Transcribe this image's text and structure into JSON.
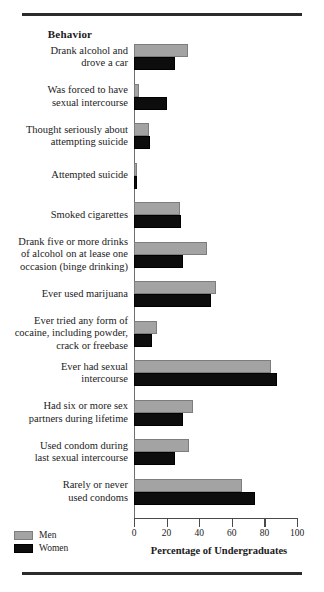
{
  "figure": {
    "column_header": "Behavior",
    "x_axis_title": "Percentage of Undergraduates"
  },
  "legend": {
    "items": [
      {
        "label": "Men",
        "color": "#a3a3a3"
      },
      {
        "label": "Women",
        "color": "#0d0d0d"
      }
    ]
  },
  "chart_data": {
    "type": "bar",
    "orientation": "horizontal",
    "title": "",
    "xlabel": "Percentage of Undergraduates",
    "ylabel": "Behavior",
    "xlim": [
      0,
      100
    ],
    "xticks": [
      0,
      20,
      40,
      60,
      80,
      100
    ],
    "grid": false,
    "legend_position": "bottom-left",
    "categories": [
      "Drank alcohol and drove a car",
      "Was forced to have sexual intercourse",
      "Thought seriously about attempting suicide",
      "Attempted suicide",
      "Smoked cigarettes",
      "Drank five or more drinks of alcohol on at lease one occasion (binge drinking)",
      "Ever used marijuana",
      "Ever tried any form of cocaine, including powder, crack or freebase",
      "Ever had sexual intercourse",
      "Had six or more sex partners during lifetime",
      "Used condom during last sexual intercourse",
      "Rarely or never used condoms"
    ],
    "category_lines": [
      [
        "Drank alcohol and",
        "drove a car"
      ],
      [
        "Was forced to have",
        "sexual intercourse"
      ],
      [
        "Thought seriously about",
        "attempting suicide"
      ],
      [
        "Attempted suicide"
      ],
      [
        "Smoked cigarettes"
      ],
      [
        "Drank five or more drinks",
        "of alcohol on at lease one",
        "occasion (binge drinking)"
      ],
      [
        "Ever used marijuana"
      ],
      [
        "Ever tried any form of",
        "cocaine, including powder,",
        "crack or freebase"
      ],
      [
        "Ever had sexual",
        "intercourse"
      ],
      [
        "Had six or more sex",
        "partners during lifetime"
      ],
      [
        "Used condom during",
        "last sexual intercourse"
      ],
      [
        "Rarely or never",
        "used condoms"
      ]
    ],
    "series": [
      {
        "name": "Men",
        "color": "#a3a3a3",
        "values": [
          33,
          3,
          9,
          2,
          28,
          45,
          50,
          14,
          84,
          36,
          34,
          66
        ]
      },
      {
        "name": "Women",
        "color": "#0d0d0d",
        "values": [
          25,
          20,
          10,
          2,
          29,
          30,
          47,
          11,
          88,
          30,
          25,
          74
        ]
      }
    ]
  }
}
